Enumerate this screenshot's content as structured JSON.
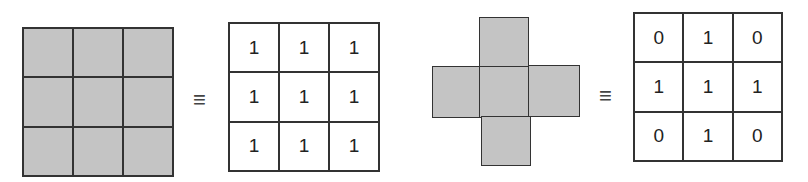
{
  "colors": {
    "fill": "#c4c4c4",
    "stroke": "#333333",
    "background": "#ffffff"
  },
  "symbols": {
    "equivalence": "≡"
  },
  "diagrams": [
    {
      "name": "square-structuring-element",
      "shape": "3x3 square",
      "mask": [
        [
          1,
          1,
          1
        ],
        [
          1,
          1,
          1
        ],
        [
          1,
          1,
          1
        ]
      ],
      "matrix": [
        [
          "1",
          "1",
          "1"
        ],
        [
          "1",
          "1",
          "1"
        ],
        [
          "1",
          "1",
          "1"
        ]
      ]
    },
    {
      "name": "cross-structuring-element",
      "shape": "plus / cross",
      "mask": [
        [
          0,
          1,
          0
        ],
        [
          1,
          1,
          1
        ],
        [
          0,
          1,
          0
        ]
      ],
      "matrix": [
        [
          "0",
          "1",
          "0"
        ],
        [
          "1",
          "1",
          "1"
        ],
        [
          "0",
          "1",
          "0"
        ]
      ]
    }
  ]
}
